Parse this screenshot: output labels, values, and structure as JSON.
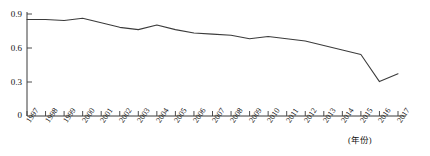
{
  "chart_data": {
    "type": "line",
    "title": "",
    "xlabel": "(年份)",
    "ylabel": "",
    "x": [
      1997,
      1998,
      1999,
      2000,
      2001,
      2002,
      2003,
      2004,
      2005,
      2006,
      2007,
      2008,
      2009,
      2010,
      2011,
      2012,
      2013,
      2014,
      2015,
      2016,
      2017
    ],
    "categories": [
      "1997",
      "1998",
      "1999",
      "2000",
      "2001",
      "2002",
      "2003",
      "2004",
      "2005",
      "2006",
      "2007",
      "2008",
      "2009",
      "2010",
      "2011",
      "2012",
      "2013",
      "2014",
      "2015",
      "2016",
      "2017"
    ],
    "values": [
      0.85,
      0.85,
      0.84,
      0.86,
      0.82,
      0.78,
      0.76,
      0.8,
      0.76,
      0.73,
      0.72,
      0.71,
      0.68,
      0.7,
      0.68,
      0.66,
      0.62,
      0.58,
      0.54,
      0.3,
      0.37
    ],
    "series": [
      {
        "name": "",
        "values": [
          0.85,
          0.85,
          0.84,
          0.86,
          0.82,
          0.78,
          0.76,
          0.8,
          0.76,
          0.73,
          0.72,
          0.71,
          0.68,
          0.7,
          0.68,
          0.66,
          0.62,
          0.58,
          0.54,
          0.3,
          0.37
        ]
      }
    ],
    "yticks": [
      0,
      0.3,
      0.6,
      0.9
    ],
    "yticklabels": [
      "0",
      "0.3",
      "0.6",
      "0.9"
    ],
    "ylim": [
      0,
      0.95
    ],
    "xlim": [
      1997,
      2017
    ],
    "grid": false,
    "legend": false,
    "legend_position": "none",
    "line_color": "#3b3b3b",
    "axis_color": "#3b3b3b"
  },
  "axis": {
    "y_labels": [
      "0.9",
      "0.6",
      "0.3",
      "0"
    ],
    "x_axis_name": "(年份)"
  }
}
